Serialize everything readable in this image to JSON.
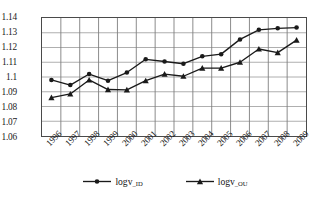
{
  "chart_data": {
    "type": "line",
    "title": "",
    "xlabel": "",
    "ylabel": "",
    "categories": [
      "1996",
      "1997",
      "1998",
      "1999",
      "2000",
      "2001",
      "2002",
      "2003",
      "2004",
      "2005",
      "2006",
      "2007",
      "2008",
      "2009"
    ],
    "ylim": [
      1.06,
      1.14
    ],
    "yticks": [
      "1.06",
      "1.07",
      "1.08",
      "1.09",
      "1.1",
      "1.11",
      "1.12",
      "1.13",
      "1.14"
    ],
    "ytick_values": [
      1.06,
      1.07,
      1.08,
      1.09,
      1.1,
      1.11,
      1.12,
      1.13,
      1.14
    ],
    "grid": true,
    "legend_position": "bottom",
    "series": [
      {
        "name": "logv_ID",
        "label_base": "logv",
        "label_sub": "_ID",
        "marker": "circle",
        "color": "#1a1a1a",
        "values": [
          1.098,
          1.0945,
          1.102,
          1.0975,
          1.103,
          1.112,
          1.1105,
          1.109,
          1.114,
          1.1155,
          1.1255,
          1.132,
          1.133,
          1.1335
        ]
      },
      {
        "name": "logv_OU",
        "label_base": "logv",
        "label_sub": "_OU",
        "marker": "triangle",
        "color": "#1a1a1a",
        "values": [
          1.086,
          1.0885,
          1.098,
          1.0915,
          1.0913,
          1.0975,
          1.102,
          1.1005,
          1.106,
          1.106,
          1.11,
          1.119,
          1.1165,
          1.125
        ]
      }
    ]
  }
}
